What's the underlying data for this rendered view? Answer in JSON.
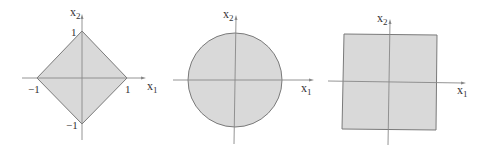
{
  "figure": {
    "fill_color": "#d9d9d9",
    "stroke_color": "#7a7a7a",
    "axis_color": "#888888",
    "panels": [
      {
        "name": "l1-ball-diamond",
        "shape": "diamond",
        "x_axis_label": "x",
        "x_axis_sub": "1",
        "y_axis_label": "x",
        "y_axis_sub": "2",
        "ticks": {
          "top": "1",
          "bottom": "−1",
          "left": "−1",
          "right": "1"
        }
      },
      {
        "name": "l2-ball-circle",
        "shape": "circle",
        "x_axis_label": "x",
        "x_axis_sub": "1",
        "y_axis_label": "x",
        "y_axis_sub": "2"
      },
      {
        "name": "linf-ball-square",
        "shape": "square",
        "x_axis_label": "x",
        "x_axis_sub": "1",
        "y_axis_label": "x",
        "y_axis_sub": "2"
      }
    ]
  }
}
